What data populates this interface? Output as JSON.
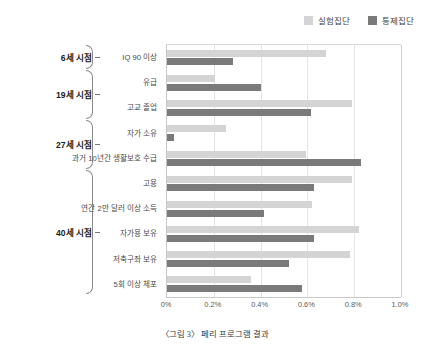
{
  "caption": "〈그림 3〉 페리 프로그램 결과",
  "legend": {
    "position": "top-right",
    "entries": [
      {
        "label": "실험집단",
        "color": "#d4d4d4",
        "key": "experimental"
      },
      {
        "label": "통제집단",
        "color": "#7a7a7a",
        "key": "control"
      }
    ]
  },
  "axis": {
    "x_ticks": [
      "0%",
      "0.2%",
      "0.4%",
      "0.6%",
      "0.8%",
      "1.0%"
    ],
    "x_min": 0,
    "x_max": 1.0,
    "xlabel": "",
    "ylabel": ""
  },
  "groups": [
    {
      "name": "6세 시점",
      "start_index": 0,
      "count": 1
    },
    {
      "name": "19세 시점",
      "start_index": 1,
      "count": 2
    },
    {
      "name": "27세 시점",
      "start_index": 3,
      "count": 2
    },
    {
      "name": "40세 시점",
      "start_index": 5,
      "count": 5
    }
  ],
  "chart_data": {
    "type": "bar",
    "orientation": "horizontal",
    "title": "",
    "subtitle": "",
    "xlabel": "",
    "ylabel": "",
    "xlim": [
      0,
      1.0
    ],
    "grid": true,
    "legend_position": "top-right",
    "tick_labels": [
      "0%",
      "0.2%",
      "0.4%",
      "0.6%",
      "0.8%",
      "1.0%"
    ],
    "categories": [
      "IQ 90 이상",
      "유급",
      "고교 졸업",
      "자가 소유",
      "과거 10년간 생활보호 수급",
      "고용",
      "연간 2만 달러 이상 소득",
      "자가용 보유",
      "저축구좌 보유",
      "5회 이상 체포"
    ],
    "series": [
      {
        "name": "실험집단",
        "color": "#d4d4d4",
        "values": [
          0.68,
          0.205,
          0.79,
          0.25,
          0.595,
          0.79,
          0.62,
          0.82,
          0.78,
          0.36
        ]
      },
      {
        "name": "통제집단",
        "color": "#7a7a7a",
        "values": [
          0.28,
          0.4,
          0.615,
          0.03,
          0.83,
          0.63,
          0.415,
          0.63,
          0.52,
          0.575
        ]
      }
    ]
  }
}
